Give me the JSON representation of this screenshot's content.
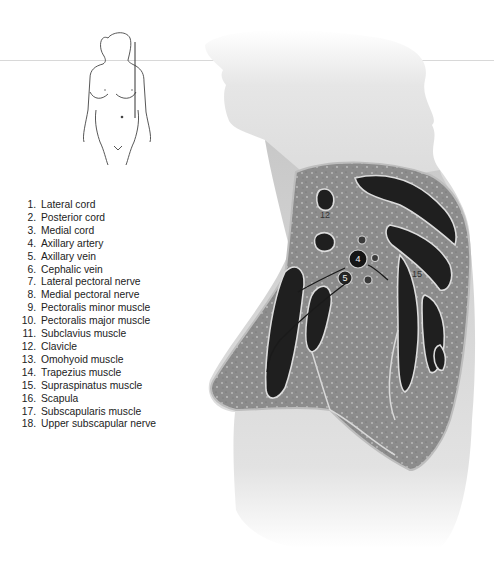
{
  "figure": {
    "thumbnail": {
      "description": "front-view female figure outline with vertical section line",
      "icon": "body-outline-icon"
    },
    "structure_labels_on_image": [
      "12",
      "4",
      "5",
      "15"
    ]
  },
  "legend": {
    "items": [
      {
        "num": "1.",
        "label": "Lateral cord"
      },
      {
        "num": "2.",
        "label": "Posterior cord"
      },
      {
        "num": "3.",
        "label": "Medial cord"
      },
      {
        "num": "4.",
        "label": "Axillary artery"
      },
      {
        "num": "5.",
        "label": "Axillary vein"
      },
      {
        "num": "6.",
        "label": "Cephalic vein"
      },
      {
        "num": "7.",
        "label": "Lateral pectoral nerve"
      },
      {
        "num": "8.",
        "label": "Medial pectoral nerve"
      },
      {
        "num": "9.",
        "label": "Pectoralis minor muscle"
      },
      {
        "num": "10.",
        "label": "Pectoralis major muscle"
      },
      {
        "num": "11.",
        "label": "Subclavius muscle"
      },
      {
        "num": "12.",
        "label": "Clavicle"
      },
      {
        "num": "13.",
        "label": "Omohyoid muscle"
      },
      {
        "num": "14.",
        "label": "Trapezius muscle"
      },
      {
        "num": "15.",
        "label": "Supraspinatus muscle"
      },
      {
        "num": "16.",
        "label": "Scapula"
      },
      {
        "num": "17.",
        "label": "Subscapularis muscle"
      },
      {
        "num": "18.",
        "label": "Upper subscapular nerve"
      }
    ]
  },
  "colors": {
    "background": "#ffffff",
    "skin": "#c9c9c9",
    "tissue": "#8a8a8a",
    "muscle": "#1e1e1e",
    "fascia": "#d6d6d6",
    "text": "#222222"
  }
}
